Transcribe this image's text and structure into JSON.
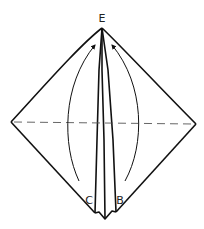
{
  "diagram": {
    "type": "origami-fold-step",
    "labels": {
      "top": "E",
      "bottom_left": "C",
      "bottom_right": "B"
    },
    "instruction_visual": "Fold flaps C and B up to point E along the arrows",
    "fold_line": "dashed horizontal valley fold",
    "colors": {
      "stroke": "#111111",
      "background": "#ffffff"
    }
  }
}
